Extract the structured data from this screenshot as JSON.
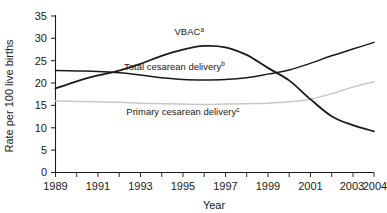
{
  "chart_data": {
    "type": "line",
    "title": "",
    "xlabel": "Year",
    "ylabel": "Rate per 100 live births",
    "xlim": [
      1989,
      2004
    ],
    "ylim": [
      0,
      35
    ],
    "grid": false,
    "legend_position": "inline-annotations",
    "x": [
      1989,
      1990,
      1991,
      1992,
      1993,
      1994,
      1995,
      1996,
      1997,
      1998,
      1999,
      2000,
      2001,
      2002,
      2003,
      2004
    ],
    "xticks": [
      "1989",
      "1991",
      "1993",
      "1995",
      "1997",
      "1999",
      "2001",
      "2003",
      "2004"
    ],
    "xtick_values": [
      1989,
      1991,
      1993,
      1995,
      1997,
      1999,
      2001,
      2003,
      2004
    ],
    "yticks": [
      "0",
      "5",
      "10",
      "15",
      "20",
      "25",
      "30",
      "35"
    ],
    "ytick_values": [
      0,
      5,
      10,
      15,
      20,
      25,
      30,
      35
    ],
    "series": [
      {
        "name": "VBAC",
        "footnote": "a",
        "label_text": "VBAC",
        "color": "#1a1a1a",
        "linewidth": 1.8,
        "values": [
          18.8,
          20.4,
          21.7,
          22.8,
          24.3,
          26.1,
          27.5,
          28.3,
          28.0,
          26.3,
          23.4,
          20.6,
          16.4,
          12.6,
          10.6,
          9.2
        ]
      },
      {
        "name": "Total cesarean delivery",
        "footnote": "b",
        "label_text": "Total cesarean delivery",
        "color": "#1a1a1a",
        "linewidth": 1.5,
        "values": [
          22.8,
          22.7,
          22.6,
          22.3,
          21.8,
          21.2,
          20.8,
          20.7,
          20.8,
          21.2,
          22.0,
          22.9,
          24.4,
          26.1,
          27.6,
          29.1
        ]
      },
      {
        "name": "Primary cesarean delivery",
        "footnote": "c",
        "label_text": "Primary cesarean delivery",
        "color": "#c8c8c8",
        "linewidth": 1.5,
        "values": [
          16.0,
          15.9,
          15.8,
          15.7,
          15.5,
          15.4,
          15.3,
          15.2,
          15.3,
          15.4,
          15.5,
          15.8,
          16.4,
          17.6,
          19.1,
          20.3
        ]
      }
    ],
    "annotations": [
      {
        "text": "VBAC",
        "sup": "a",
        "x": 1995.3,
        "y": 30.8
      },
      {
        "text": "Total cesarean delivery",
        "sup": "b",
        "x": 1994.6,
        "y": 23.0
      },
      {
        "text": "Primary cesarean delivery",
        "sup": "c",
        "x": 1995.0,
        "y": 12.9
      }
    ]
  }
}
